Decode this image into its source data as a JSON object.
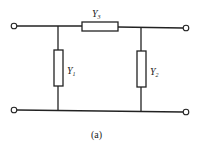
{
  "diagram": {
    "type": "two-port pi network",
    "caption": "(a)",
    "components": [
      {
        "id": "Y3",
        "symbol": "Y",
        "subscript": "3",
        "position": "series-top"
      },
      {
        "id": "Y1",
        "symbol": "Y",
        "subscript": "1",
        "position": "shunt-left"
      },
      {
        "id": "Y2",
        "symbol": "Y",
        "subscript": "2",
        "position": "shunt-right"
      }
    ],
    "terminals": [
      "top-left",
      "top-right",
      "bottom-left",
      "bottom-right"
    ]
  }
}
